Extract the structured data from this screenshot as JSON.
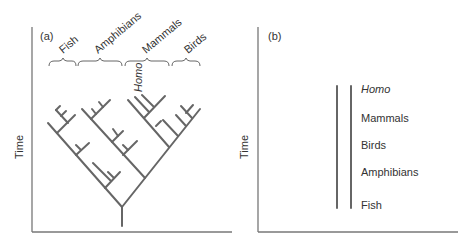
{
  "panel_a": {
    "label": "(a)",
    "y_axis_label": "Time",
    "groups": [
      {
        "name": "Fish",
        "italic": false
      },
      {
        "name": "Amphibians",
        "italic": false
      },
      {
        "name": "Mammals",
        "italic": false
      },
      {
        "name": "Birds",
        "italic": false
      }
    ],
    "homo_label": "Homo",
    "description": "Branching phylogenetic tree with four clades"
  },
  "panel_b": {
    "label": "(b)",
    "y_axis_label": "Time",
    "levels": [
      {
        "name": "Homo",
        "italic": true
      },
      {
        "name": "Mammals",
        "italic": false
      },
      {
        "name": "Birds",
        "italic": false
      },
      {
        "name": "Amphibians",
        "italic": false
      },
      {
        "name": "Fish",
        "italic": false
      }
    ],
    "description": "Linear ladder of progress, Fish to Homo"
  },
  "colors": {
    "line": "#666666",
    "axis": "#777777",
    "text": "#333333"
  }
}
